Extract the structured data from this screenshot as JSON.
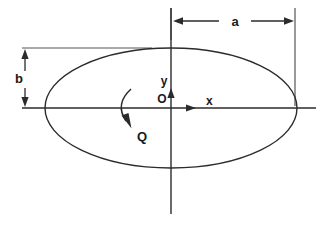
{
  "figure": {
    "type": "geometric-diagram",
    "width": 332,
    "height": 226,
    "background_color": "#ffffff",
    "line_color": "#2b2b2b"
  },
  "labels": {
    "semi_major_axis": "a",
    "semi_minor_axis": "b",
    "x_axis": "x",
    "y_axis": "y",
    "origin": "O",
    "rotation": "Q"
  },
  "geometry": {
    "ellipse": {
      "center_x": 171,
      "center_y": 108,
      "semi_axis_x": 126,
      "semi_axis_y": 60
    },
    "dimension_a": {
      "label": "a",
      "y": 21,
      "x_start": 173,
      "x_end": 294,
      "label_x": 235,
      "orientation": "horizontal",
      "arrowheads": "both"
    },
    "dimension_b": {
      "label": "b",
      "x": 25,
      "y_start": 49,
      "y_end": 107,
      "label_y": 82,
      "orientation": "vertical",
      "arrowheads": "both"
    },
    "x_axis": {
      "label": "x",
      "y": 108,
      "x_start": 22,
      "x_end": 316,
      "arrow_tip_x": 196,
      "label_x": 206,
      "label_y": 104
    },
    "y_axis": {
      "label": "y",
      "x": 171,
      "y_start": 8,
      "y_end": 214,
      "arrow_tip_y": 88,
      "label_x": 164,
      "label_y": 84
    },
    "origin": {
      "label": "O",
      "x": 162,
      "y": 102
    },
    "rotation_arrow": {
      "label": "Q",
      "start_x": 131,
      "start_y": 89,
      "end_x": 130,
      "end_y": 126,
      "label_x": 137,
      "label_y": 140,
      "direction": "clockwise-downward"
    }
  }
}
